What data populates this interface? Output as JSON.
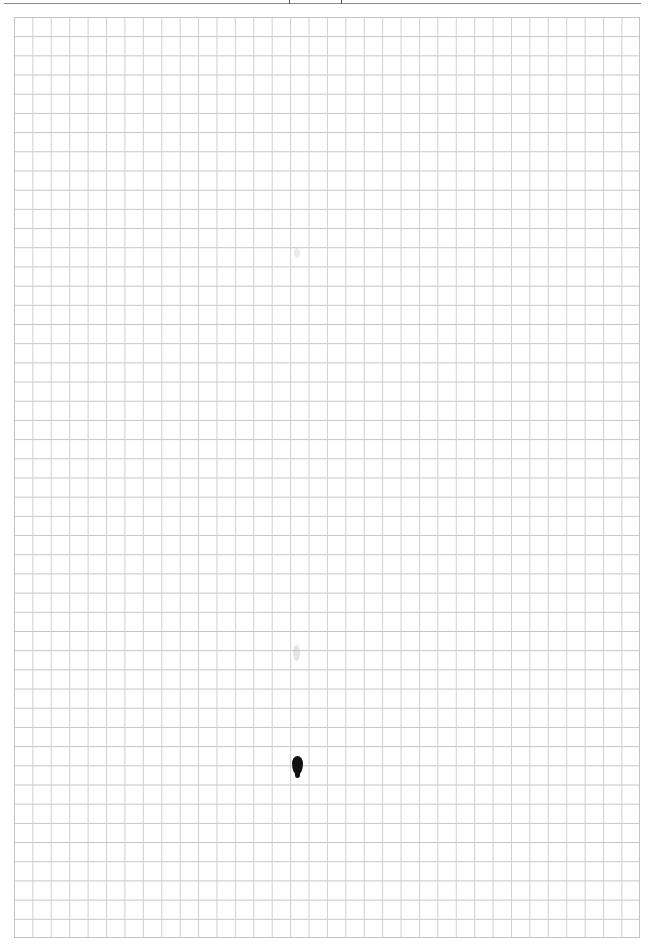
{
  "page": {
    "type": "graph-paper",
    "background_color": "#ffffff",
    "grid": {
      "columns": 34,
      "rows": 48,
      "cell_width_px": 18.42,
      "cell_height_px": 19.2,
      "line_color": "#c4c4c4"
    },
    "header_rule_color": "#8a8a8a",
    "marks": [
      {
        "name": "ink-drop",
        "color": "#111111"
      },
      {
        "name": "faint-smudge-upper"
      },
      {
        "name": "faint-smudge-lower"
      }
    ]
  }
}
